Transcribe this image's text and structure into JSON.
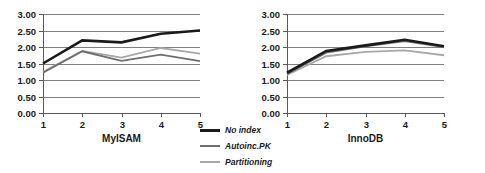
{
  "legend": {
    "position": "bottom-center",
    "entries": [
      {
        "label": "No index",
        "color": "#1a1a1a",
        "width": 2.6
      },
      {
        "label": "Autoinc.PK",
        "color": "#6e6e6e",
        "width": 1.8
      },
      {
        "label": "Partitioning",
        "color": "#a8a8a8",
        "width": 1.8
      }
    ]
  },
  "axis": {
    "ytick_labels": [
      "3.00",
      "2.50",
      "2.00",
      "1.50",
      "1.00",
      "0.50",
      "0.00"
    ],
    "xtick_labels": [
      "1",
      "2",
      "3",
      "4",
      "5"
    ]
  },
  "chart_data": [
    {
      "type": "line",
      "title": "",
      "xlabel": "MyISAM",
      "ylabel": "",
      "categories": [
        "1",
        "2",
        "3",
        "4",
        "5"
      ],
      "x": [
        1,
        2,
        3,
        4,
        5
      ],
      "ylim": [
        0.0,
        3.0
      ],
      "yticks": [
        0.0,
        0.5,
        1.0,
        1.5,
        2.0,
        2.5,
        3.0
      ],
      "grid": true,
      "series": [
        {
          "name": "No index",
          "color": "#1a1a1a",
          "values": [
            1.5,
            2.2,
            2.14,
            2.4,
            2.5
          ]
        },
        {
          "name": "Autoinc.PK",
          "color": "#6e6e6e",
          "values": [
            1.22,
            1.87,
            1.58,
            1.77,
            1.57
          ]
        },
        {
          "name": "Partitioning",
          "color": "#a8a8a8",
          "values": [
            1.25,
            1.88,
            1.68,
            1.97,
            1.8
          ]
        }
      ]
    },
    {
      "type": "line",
      "title": "",
      "xlabel": "InnoDB",
      "ylabel": "",
      "categories": [
        "1",
        "2",
        "3",
        "4",
        "5"
      ],
      "x": [
        1,
        2,
        3,
        4,
        5
      ],
      "ylim": [
        0.0,
        3.0
      ],
      "yticks": [
        0.0,
        0.5,
        1.0,
        1.5,
        2.0,
        2.5,
        3.0
      ],
      "grid": true,
      "series": [
        {
          "name": "No index",
          "color": "#1a1a1a",
          "values": [
            1.22,
            1.88,
            2.05,
            2.22,
            2.02
          ]
        },
        {
          "name": "Autoinc.PK",
          "color": "#6e6e6e",
          "values": [
            1.18,
            1.83,
            2.02,
            2.18,
            2.0
          ]
        },
        {
          "name": "Partitioning",
          "color": "#a8a8a8",
          "values": [
            1.15,
            1.72,
            1.85,
            1.9,
            1.75
          ]
        }
      ]
    }
  ]
}
